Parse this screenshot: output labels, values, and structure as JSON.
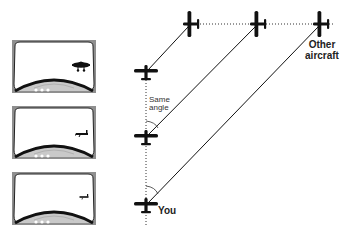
{
  "diagram": {
    "labels": {
      "same_angle_line1": "Same",
      "same_angle_line2": "angle",
      "other_aircraft_line1": "Other",
      "other_aircraft_line2": "aircraft",
      "you": "You"
    },
    "panels": [
      {
        "id": "windshield-view-1",
        "description": "Other aircraft appears large in windshield",
        "aircraft_size": "large"
      },
      {
        "id": "windshield-view-2",
        "description": "Other aircraft appears medium in windshield",
        "aircraft_size": "medium"
      },
      {
        "id": "windshield-view-3",
        "description": "Other aircraft appears small in windshield",
        "aircraft_size": "small"
      }
    ],
    "own_aircraft_positions": [
      {
        "x": 146,
        "y": 205
      },
      {
        "x": 146,
        "y": 137
      },
      {
        "x": 146,
        "y": 72
      }
    ],
    "other_aircraft_positions": [
      {
        "x": 320,
        "y": 24
      },
      {
        "x": 257,
        "y": 24
      },
      {
        "x": 190,
        "y": 24
      }
    ],
    "colors": {
      "ink": "#111111",
      "panel_frame": "#8a8a8a",
      "panel_glass": "#ffffff",
      "cowling_light": "#bdbdbd"
    }
  }
}
